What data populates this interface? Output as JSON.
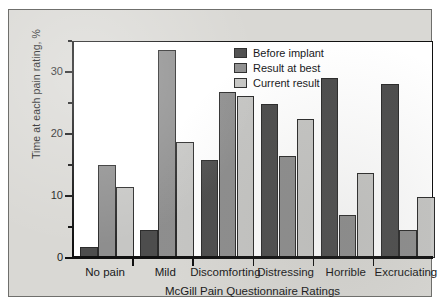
{
  "chart_data": {
    "type": "bar",
    "title": "",
    "xlabel": "McGill Pain Questionnaire Ratings",
    "ylabel": "Time at each pain rating, %",
    "categories": [
      "No pain",
      "Mild",
      "Discomforting",
      "Distressing",
      "Horrible",
      "Excruciating"
    ],
    "series": [
      {
        "name": "Before implant",
        "color": "#4d4d4d",
        "values": [
          1.7,
          4.5,
          15.8,
          24.8,
          29.0,
          28.0
        ]
      },
      {
        "name": "Result at best",
        "color": "#8e8e8e",
        "values": [
          15.0,
          33.5,
          26.8,
          16.5,
          7.0,
          4.5
        ]
      },
      {
        "name": "Current result",
        "color": "#c6c6c4",
        "values": [
          11.5,
          18.7,
          26.2,
          22.5,
          13.7,
          9.8
        ]
      }
    ],
    "ylim": [
      0,
      35
    ],
    "y_ticks_major": [
      0,
      10,
      20,
      30
    ],
    "y_tick_labels": [
      "0",
      "10",
      "20",
      "30"
    ],
    "y_ticks_minor": [
      5,
      15,
      25,
      35
    ],
    "grid": false,
    "legend_position": "top-right"
  },
  "legend": {
    "entries": [
      {
        "label": "Before implant"
      },
      {
        "label": "Result at best"
      },
      {
        "label": "Current result"
      }
    ]
  }
}
